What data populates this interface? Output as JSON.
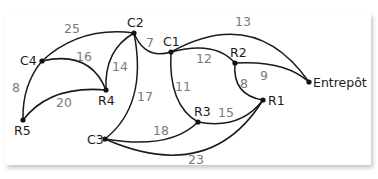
{
  "diagram": {
    "type": "weighted-graph",
    "nodes": [
      {
        "id": "C2",
        "label": "C2"
      },
      {
        "id": "C1",
        "label": "C1"
      },
      {
        "id": "C4",
        "label": "C4"
      },
      {
        "id": "R2",
        "label": "R2"
      },
      {
        "id": "R4",
        "label": "R4"
      },
      {
        "id": "R5",
        "label": "R5"
      },
      {
        "id": "R3",
        "label": "R3"
      },
      {
        "id": "R1",
        "label": "R1"
      },
      {
        "id": "C3",
        "label": "C3"
      },
      {
        "id": "Entrepot",
        "label": "Entrepôt"
      }
    ],
    "edges": [
      {
        "from": "C4",
        "to": "C2",
        "weight": "25"
      },
      {
        "from": "C4",
        "to": "R4",
        "weight": "16"
      },
      {
        "from": "R4",
        "to": "C2",
        "weight": "14"
      },
      {
        "from": "C2",
        "to": "C1",
        "weight": "7"
      },
      {
        "from": "C1",
        "to": "Entrepot",
        "weight": "13"
      },
      {
        "from": "C1",
        "to": "R2",
        "weight": "12"
      },
      {
        "from": "R2",
        "to": "Entrepot",
        "weight": "9"
      },
      {
        "from": "R2",
        "to": "R1",
        "weight": "8"
      },
      {
        "from": "C4",
        "to": "R5",
        "weight": "8"
      },
      {
        "from": "R5",
        "to": "R4",
        "weight": "20"
      },
      {
        "from": "C2",
        "to": "C3",
        "weight": "17"
      },
      {
        "from": "C1",
        "to": "R3",
        "weight": "11"
      },
      {
        "from": "R3",
        "to": "R1",
        "weight": "15"
      },
      {
        "from": "C3",
        "to": "R3",
        "weight": "18"
      },
      {
        "from": "C3",
        "to": "R1",
        "weight": "23"
      }
    ]
  }
}
